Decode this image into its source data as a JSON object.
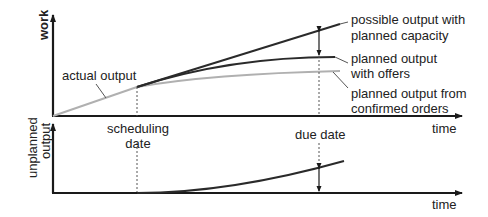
{
  "diagram": {
    "top_panel": {
      "y_axis_label": "work",
      "x_axis_label": "time",
      "curves": [
        {
          "id": "actual_output",
          "label": "actual output",
          "color": "#b0b0b0"
        },
        {
          "id": "possible_output",
          "label_line1": "possible output with",
          "label_line2": "planned capacity",
          "color": "#2a2a2a"
        },
        {
          "id": "planned_with_offers",
          "label_line1": "planned output",
          "label_line2": "with offers",
          "color": "#2a2a2a"
        },
        {
          "id": "planned_confirmed",
          "label_line1": "planned output from",
          "label_line2": "confirmed orders",
          "color": "#b0b0b0"
        }
      ]
    },
    "bottom_panel": {
      "y_axis_label_line1": "unplanned",
      "y_axis_label_line2": "output",
      "x_axis_label": "time",
      "curve": {
        "id": "unplanned_output",
        "color": "#2a2a2a"
      }
    },
    "markers": {
      "scheduling_date_line1": "scheduling",
      "scheduling_date_line2": "date",
      "due_date": "due date"
    },
    "colors": {
      "axis": "#1a1a1a",
      "dark_curve": "#2a2a2a",
      "light_curve": "#b0b0b0",
      "dashed": "#555555"
    }
  }
}
